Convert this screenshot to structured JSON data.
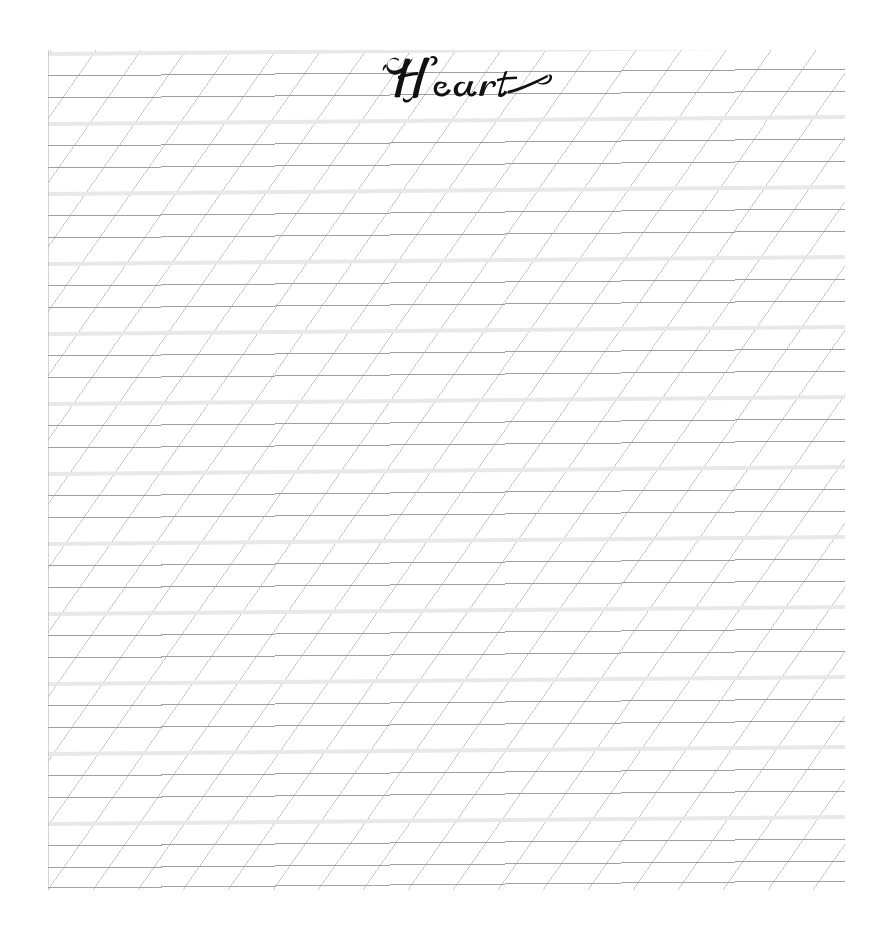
{
  "document": {
    "kind": "calligraphy-practice-worksheet",
    "title_word": "Heart",
    "script_style": "Copperplate",
    "background_color": "#ffffff"
  },
  "worksheet": {
    "area": {
      "left": 48,
      "top": 50,
      "width": 797,
      "height": 840
    },
    "colors": {
      "baseline_band": "#e8e8e8",
      "rule_line": "#9a9a9a",
      "slant_line": "#b9b9b9",
      "boundary_line": "#a8a8a8"
    },
    "horizontal_rules": {
      "group_count": 12,
      "group_period_px": 70,
      "pattern": [
        "ascender-band",
        "waist-line",
        "base-line"
      ],
      "band_thickness_px": 4,
      "line_thickness_px": 1
    },
    "slant_guides": {
      "angle_degrees": 55,
      "spacing_px": 45,
      "count": 40
    },
    "baseline_tilt_degrees": 0.5
  },
  "chart_data": {
    "type": "table",
    "categories": [
      "ascender band",
      "waist line",
      "base line",
      "slant guide"
    ],
    "values": [
      12,
      12,
      12,
      40
    ]
  }
}
